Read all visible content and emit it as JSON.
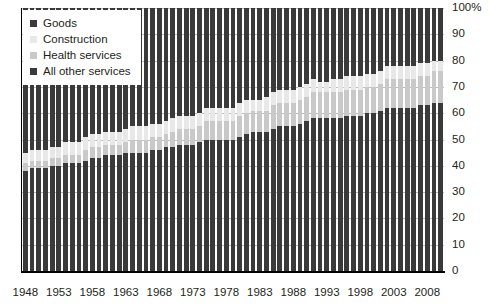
{
  "chart_data": {
    "type": "bar",
    "title": "",
    "subtitle": "",
    "xlabel": "",
    "ylabel": "",
    "stacked": true,
    "normalized": "100 percent stacked",
    "grid": true,
    "legend_position": "top-left",
    "ylim": [
      0,
      100
    ],
    "ytick_labels": [
      "100%",
      "90",
      "80",
      "70",
      "60",
      "50",
      "40",
      "30",
      "20",
      "10",
      "0"
    ],
    "ytick_values": [
      100,
      90,
      80,
      70,
      60,
      50,
      40,
      30,
      20,
      10,
      0
    ],
    "xtick_labels": [
      "1948",
      "1953",
      "1958",
      "1963",
      "1968",
      "1973",
      "1978",
      "1983",
      "1988",
      "1993",
      "1998",
      "2003",
      "2008"
    ],
    "xtick_values": [
      1948,
      1953,
      1958,
      1963,
      1968,
      1973,
      1978,
      1983,
      1988,
      1993,
      1998,
      2003,
      2008
    ],
    "categories": [
      1948,
      1949,
      1950,
      1951,
      1952,
      1953,
      1954,
      1955,
      1956,
      1957,
      1958,
      1959,
      1960,
      1961,
      1962,
      1963,
      1964,
      1965,
      1966,
      1967,
      1968,
      1969,
      1970,
      1971,
      1972,
      1973,
      1974,
      1975,
      1976,
      1977,
      1978,
      1979,
      1980,
      1981,
      1982,
      1983,
      1984,
      1985,
      1986,
      1987,
      1988,
      1989,
      1990,
      1991,
      1992,
      1993,
      1994,
      1995,
      1996,
      1997,
      1998,
      1999,
      2000,
      2001,
      2002,
      2003,
      2004,
      2005,
      2006,
      2007,
      2008,
      2009,
      2010
    ],
    "series": [
      {
        "name": "All other services",
        "color": "#3a3a3a",
        "values": [
          38,
          39,
          39,
          39,
          40,
          40,
          41,
          41,
          41,
          42,
          43,
          43,
          44,
          44,
          44,
          45,
          45,
          45,
          45,
          46,
          46,
          47,
          47,
          48,
          48,
          48,
          49,
          50,
          50,
          50,
          50,
          50,
          51,
          52,
          53,
          53,
          53,
          54,
          55,
          55,
          55,
          56,
          57,
          58,
          58,
          58,
          58,
          58,
          59,
          59,
          59,
          60,
          60,
          61,
          62,
          62,
          62,
          62,
          62,
          63,
          63,
          64,
          64
        ]
      },
      {
        "name": "Health services",
        "color": "#c9c9c9",
        "values": [
          3,
          3,
          3,
          3,
          3,
          3,
          3,
          3,
          3,
          4,
          4,
          4,
          4,
          4,
          4,
          4,
          5,
          5,
          5,
          5,
          5,
          5,
          6,
          6,
          6,
          6,
          6,
          7,
          7,
          7,
          7,
          7,
          8,
          8,
          8,
          8,
          8,
          9,
          9,
          9,
          9,
          9,
          9,
          10,
          10,
          10,
          10,
          10,
          10,
          10,
          10,
          10,
          10,
          10,
          11,
          11,
          11,
          11,
          11,
          11,
          11,
          12,
          12
        ]
      },
      {
        "name": "Construction",
        "color": "#e8e8e8",
        "values": [
          4,
          4,
          4,
          4,
          4,
          4,
          5,
          5,
          5,
          5,
          5,
          5,
          5,
          5,
          5,
          5,
          5,
          5,
          5,
          5,
          5,
          5,
          5,
          5,
          5,
          5,
          5,
          5,
          5,
          5,
          5,
          5,
          5,
          5,
          4,
          4,
          5,
          5,
          5,
          5,
          5,
          5,
          5,
          5,
          4,
          4,
          5,
          5,
          5,
          5,
          5,
          5,
          5,
          5,
          5,
          5,
          5,
          5,
          5,
          5,
          5,
          4,
          4
        ]
      },
      {
        "name": "Goods",
        "color": "#3a3a3a",
        "values": [
          55,
          54,
          54,
          54,
          53,
          53,
          51,
          51,
          51,
          49,
          48,
          48,
          47,
          47,
          47,
          46,
          45,
          45,
          45,
          44,
          44,
          43,
          42,
          41,
          41,
          41,
          40,
          38,
          38,
          38,
          38,
          38,
          36,
          35,
          35,
          35,
          34,
          32,
          31,
          31,
          31,
          30,
          29,
          27,
          28,
          28,
          27,
          27,
          26,
          26,
          26,
          25,
          25,
          24,
          22,
          22,
          22,
          22,
          22,
          21,
          21,
          20,
          20
        ]
      }
    ]
  },
  "legend": {
    "items": [
      {
        "label": "Goods",
        "color": "#3a3a3a"
      },
      {
        "label": "Construction",
        "color": "#e8e8e8"
      },
      {
        "label": "Health services",
        "color": "#c9c9c9"
      },
      {
        "label": "All other services",
        "color": "#3a3a3a"
      }
    ]
  }
}
